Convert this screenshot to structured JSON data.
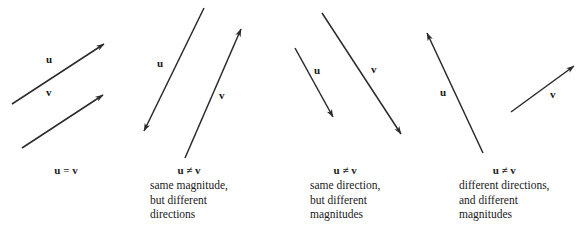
{
  "figure": {
    "background_color": "#ffffff",
    "stroke_color": "#2b2b2b",
    "text_color": "#1a1a1a",
    "width": 582,
    "height": 227,
    "panels": [
      {
        "id": "panel-equal",
        "caption": {
          "relation": "u = v",
          "description_lines": []
        },
        "vectors": [
          {
            "name": "u",
            "label": "u",
            "label_x": 46,
            "label_y": 54,
            "x1": 12,
            "y1": 104,
            "x2": 104,
            "y2": 44
          },
          {
            "name": "v",
            "label": "v",
            "label_x": 46,
            "label_y": 87,
            "x1": 22,
            "y1": 148,
            "x2": 103,
            "y2": 95
          }
        ]
      },
      {
        "id": "panel-same-magnitude",
        "caption": {
          "relation": "u ≠ v",
          "description_lines": [
            "same magnitude,",
            "but different",
            "directions"
          ]
        },
        "vectors": [
          {
            "name": "u",
            "label": "u",
            "label_x": 157,
            "label_y": 58,
            "x1": 204,
            "y1": 8,
            "x2": 144,
            "y2": 131
          },
          {
            "name": "v",
            "label": "v",
            "label_x": 219,
            "label_y": 90,
            "x1": 185,
            "y1": 158,
            "x2": 241,
            "y2": 29
          }
        ]
      },
      {
        "id": "panel-same-direction",
        "caption": {
          "relation": "u ≠ v",
          "description_lines": [
            "same direction,",
            "but different",
            "magnitudes"
          ]
        },
        "vectors": [
          {
            "name": "u",
            "label": "u",
            "label_x": 314,
            "label_y": 65,
            "x1": 295,
            "y1": 48,
            "x2": 333,
            "y2": 117
          },
          {
            "name": "v",
            "label": "v",
            "label_x": 371,
            "label_y": 64,
            "x1": 322,
            "y1": 13,
            "x2": 401,
            "y2": 134
          }
        ]
      },
      {
        "id": "panel-different-both",
        "caption": {
          "relation": "u ≠ v",
          "description_lines": [
            "different directions,",
            "and different",
            "magnitudes"
          ]
        },
        "vectors": [
          {
            "name": "u",
            "label": "u",
            "label_x": 440,
            "label_y": 87,
            "x1": 483,
            "y1": 153,
            "x2": 427,
            "y2": 33
          },
          {
            "name": "v",
            "label": "v",
            "label_x": 550,
            "label_y": 89,
            "x1": 511,
            "y1": 112,
            "x2": 574,
            "y2": 66
          }
        ]
      }
    ]
  },
  "captions": {
    "panel1": {
      "relation": "u = v",
      "x": 36,
      "y": 163
    },
    "panel2": {
      "relation": "u ≠ v",
      "line1": "same magnitude,",
      "line2": "but different",
      "line3": "directions",
      "x": 150,
      "y": 163
    },
    "panel3": {
      "relation": "u ≠ v",
      "line1": "same direction,",
      "line2": "but different",
      "line3": "magnitudes",
      "x": 310,
      "y": 163
    },
    "panel4": {
      "relation": "u ≠ v",
      "line1": "different directions,",
      "line2": "and different",
      "line3": "magnitudes",
      "x": 459,
      "y": 163
    }
  }
}
